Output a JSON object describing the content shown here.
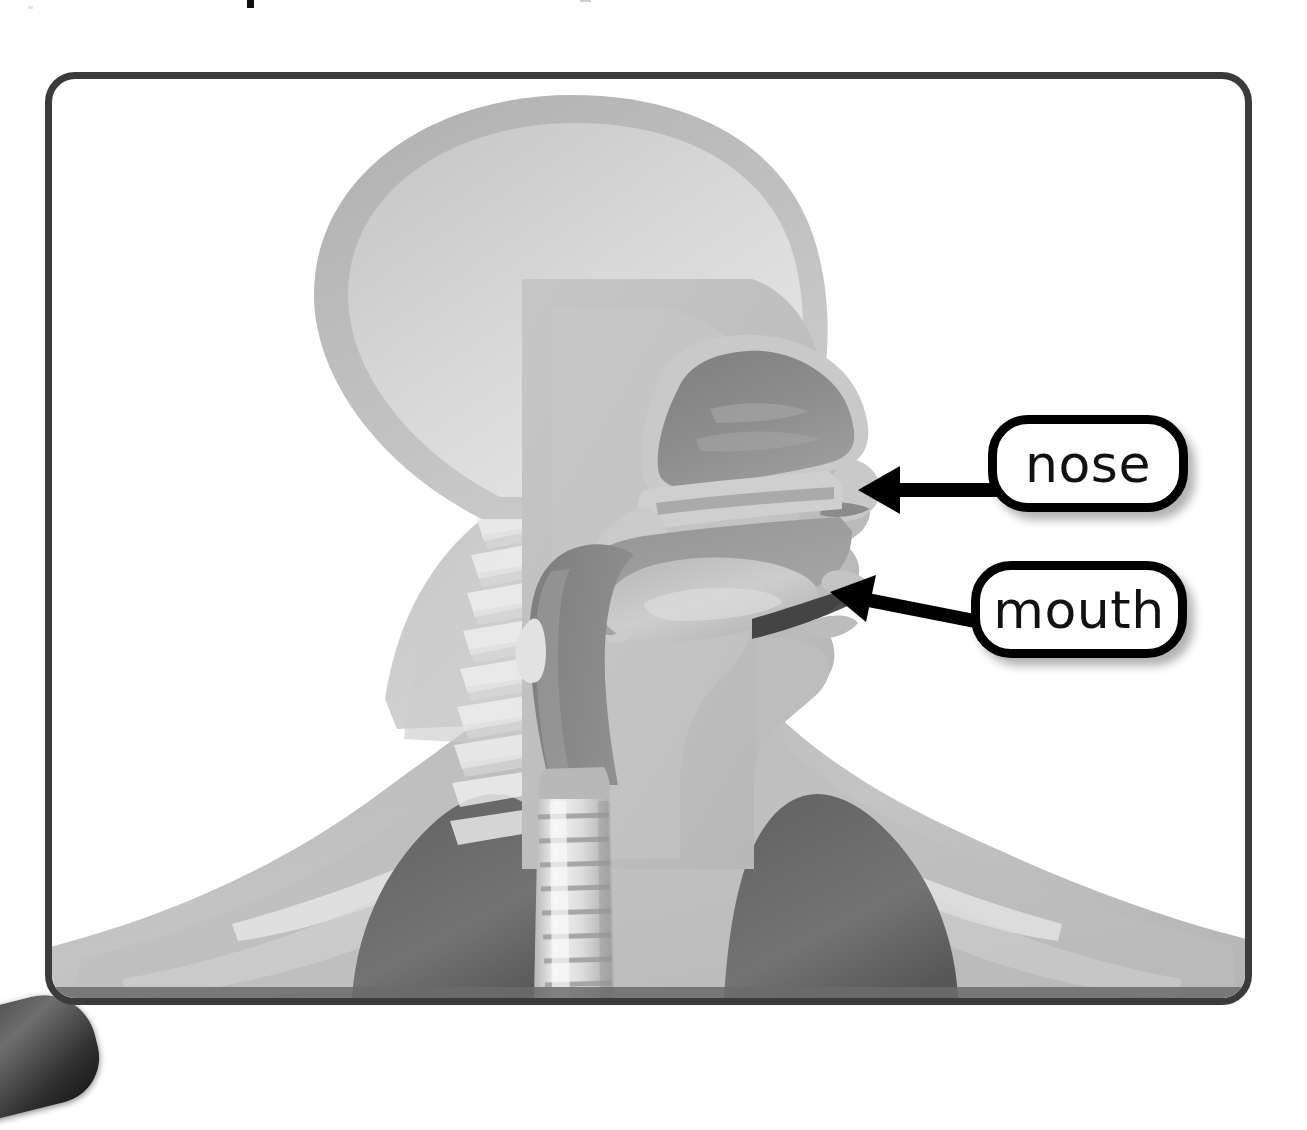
{
  "page": {
    "background_color": "#ffffff",
    "width": 1307,
    "height": 1047
  },
  "frame": {
    "border_color": "#3b3b3b",
    "border_width": 7,
    "corner_radius": 30,
    "fill_color": "#ffffff"
  },
  "illustration": {
    "name": "head-and-neck-sagittal-cross-section",
    "description": "Grayscale side view cross-section of a human head, neck and upper chest showing the nasal cavity, oral cavity, pharynx, trachea, spine and lung tops",
    "parts": [
      {
        "name": "skull-brain-region",
        "color": "#d3d3d3"
      },
      {
        "name": "scalp-outline",
        "color": "#b7b7b7"
      },
      {
        "name": "face-profile",
        "color": "#c2c2c2"
      },
      {
        "name": "nasal-cavity",
        "color": "#8e8e8e"
      },
      {
        "name": "oral-cavity",
        "color": "#9a9a9a"
      },
      {
        "name": "tongue",
        "color": "#b0b0b0"
      },
      {
        "name": "soft-palate",
        "color": "#a5a5a5"
      },
      {
        "name": "pharynx",
        "color": "#8a8a8a"
      },
      {
        "name": "trachea",
        "color": "#e2e2e2"
      },
      {
        "name": "spine-vertebrae",
        "color": "#ededed"
      },
      {
        "name": "lung-left",
        "color": "#6f6f6f"
      },
      {
        "name": "lung-right",
        "color": "#6f6f6f"
      },
      {
        "name": "shoulders-torso",
        "color": "#bfbfbf"
      },
      {
        "name": "clavicle",
        "color": "#e8e8e8"
      }
    ]
  },
  "callouts": [
    {
      "id": "nose",
      "label": "nose",
      "box": {
        "x": 988,
        "y": 415,
        "width": 200,
        "height": 97
      },
      "border_color": "#000000",
      "fill_color": "#ffffff",
      "text_color": "#111111"
    },
    {
      "id": "mouth",
      "label": "mouth",
      "box": {
        "x": 971,
        "y": 561,
        "width": 216,
        "height": 97
      },
      "border_color": "#000000",
      "fill_color": "#ffffff",
      "text_color": "#111111"
    }
  ],
  "arrows": [
    {
      "id": "arrow-to-nose",
      "name": "nose-pointer-arrow",
      "color": "#000000",
      "from": {
        "x": 988,
        "y": 490
      },
      "to": {
        "x": 858,
        "y": 490
      },
      "direction": "left"
    },
    {
      "id": "arrow-to-mouth",
      "name": "mouth-pointer-arrow",
      "color": "#000000",
      "from": {
        "x": 975,
        "y": 621
      },
      "to": {
        "x": 830,
        "y": 592
      },
      "direction": "left-up"
    }
  ],
  "corner_graphic": {
    "name": "cut-off-rounded-shape-bottom-left",
    "color": "#3a3a3a"
  }
}
